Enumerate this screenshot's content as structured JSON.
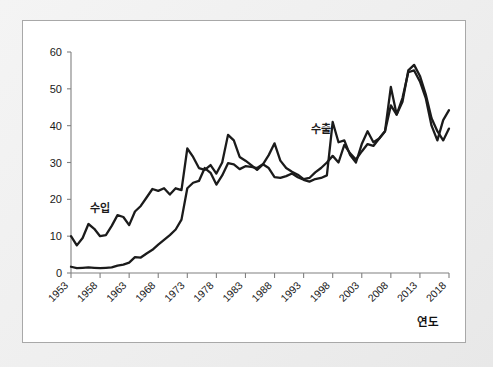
{
  "figure": {
    "background_color": "#eeeeee",
    "panel_color": "#ffffff",
    "panel_border_color": "#a8a8a8",
    "line_color": "#1b1b1b",
    "axis_color": "#808080"
  },
  "axes": {
    "x_axis_title": "연도",
    "y_tick_labels": [
      "0",
      "10",
      "20",
      "30",
      "40",
      "50",
      "60"
    ],
    "x_tick_labels": [
      "1953",
      "1958",
      "1963",
      "1968",
      "1973",
      "1978",
      "1983",
      "1988",
      "1993",
      "1998",
      "2003",
      "2008",
      "2013",
      "2018"
    ]
  },
  "annotations": {
    "import_label": "수입",
    "export_label": "수출"
  },
  "chart_data": {
    "type": "line",
    "title": "",
    "subtitle": "",
    "xlabel": "연도",
    "ylabel": "",
    "xlim": [
      1953,
      2018
    ],
    "ylim": [
      0,
      60
    ],
    "yticks": [
      0,
      10,
      20,
      30,
      40,
      50,
      60
    ],
    "xticks": [
      1953,
      1958,
      1963,
      1968,
      1973,
      1978,
      1983,
      1988,
      1993,
      1998,
      2003,
      2008,
      2013,
      2018
    ],
    "grid": false,
    "legend_position": "inline-annotation",
    "annotations": [
      {
        "text": "수입",
        "x": 1958,
        "y": 16.5,
        "note": "imports series label"
      },
      {
        "text": "수출",
        "x": 1996,
        "y": 38.0,
        "note": "exports series label"
      }
    ],
    "x": [
      1953,
      1954,
      1955,
      1956,
      1957,
      1958,
      1959,
      1960,
      1961,
      1962,
      1963,
      1964,
      1965,
      1966,
      1967,
      1968,
      1969,
      1970,
      1971,
      1972,
      1973,
      1974,
      1975,
      1976,
      1977,
      1978,
      1979,
      1980,
      1981,
      1982,
      1983,
      1984,
      1985,
      1986,
      1987,
      1988,
      1989,
      1990,
      1991,
      1992,
      1993,
      1994,
      1995,
      1996,
      1997,
      1998,
      1999,
      2000,
      2001,
      2002,
      2003,
      2004,
      2005,
      2006,
      2007,
      2008,
      2009,
      2010,
      2011,
      2012,
      2013,
      2014,
      2015,
      2016,
      2017,
      2018
    ],
    "series": [
      {
        "name": "수입",
        "name_en": "Imports",
        "values": [
          10.0,
          7.5,
          9.5,
          13.3,
          12.0,
          10.0,
          10.3,
          12.8,
          15.7,
          15.2,
          13.0,
          16.7,
          18.2,
          20.5,
          22.8,
          22.3,
          23.0,
          21.3,
          23.0,
          22.5,
          33.8,
          31.5,
          28.5,
          28.0,
          29.3,
          27.0,
          30.0,
          37.5,
          36.0,
          31.5,
          30.5,
          29.3,
          28.0,
          29.5,
          32.0,
          35.2,
          30.5,
          28.5,
          27.5,
          26.7,
          25.5,
          25.8,
          27.3,
          28.5,
          30.0,
          31.8,
          30.0,
          34.8,
          32.5,
          30.8,
          33.0,
          35.0,
          34.5,
          36.5,
          38.5,
          50.5,
          43.0,
          47.5,
          54.5,
          55.0,
          52.0,
          47.5,
          40.0,
          36.0,
          41.5,
          44.2
        ],
        "color": "#1b1b1b"
      },
      {
        "name": "수출",
        "name_en": "Exports",
        "values": [
          1.7,
          1.3,
          1.4,
          1.5,
          1.4,
          1.3,
          1.4,
          1.5,
          2.0,
          2.3,
          2.8,
          4.3,
          4.2,
          5.3,
          6.3,
          7.7,
          9.0,
          10.3,
          11.8,
          14.5,
          23.0,
          24.5,
          25.0,
          28.5,
          27.2,
          24.0,
          26.5,
          29.8,
          29.5,
          28.2,
          29.0,
          28.8,
          28.5,
          29.5,
          28.5,
          26.0,
          25.8,
          26.3,
          27.0,
          26.0,
          25.3,
          24.8,
          25.5,
          25.8,
          26.5,
          41.0,
          35.5,
          36.0,
          32.0,
          30.0,
          35.0,
          38.5,
          35.5,
          36.5,
          38.5,
          45.5,
          43.0,
          46.5,
          55.0,
          56.5,
          53.5,
          48.5,
          42.0,
          38.5,
          36.0,
          39.2
        ],
        "color": "#1b1b1b"
      }
    ]
  }
}
